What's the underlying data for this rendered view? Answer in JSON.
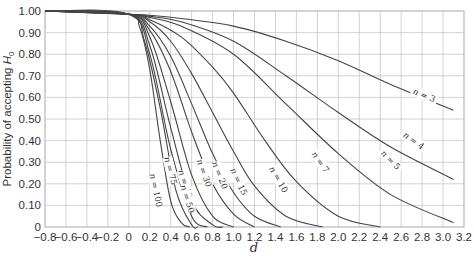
{
  "chart_data": {
    "type": "line",
    "title": "",
    "xlabel": "d",
    "ylabel": "Probability of accepting H0",
    "ylabel_main": "Probability of accepting ",
    "ylabel_sym": "H",
    "ylabel_sub": "0",
    "xlim": [
      -0.8,
      3.2
    ],
    "ylim": [
      0,
      1.0
    ],
    "grid": true,
    "x_ticks": [
      -0.8,
      -0.6,
      -0.4,
      -0.2,
      0,
      0.2,
      0.4,
      0.6,
      0.8,
      1.0,
      1.2,
      1.4,
      1.6,
      1.8,
      2.0,
      2.2,
      2.4,
      2.6,
      2.8,
      3.0,
      3.2
    ],
    "x_tick_labels": [
      "−0.8",
      "−0.6",
      "−0.4",
      "−0.2",
      "0",
      "0.2",
      "0.4",
      "0.6",
      "0.8",
      "1.0",
      "1.2",
      "1.4",
      "1.6",
      "1.8",
      "2.0",
      "2.2",
      "2.4",
      "2.6",
      "2.8",
      "3.0",
      "3.2"
    ],
    "y_ticks": [
      0,
      0.1,
      0.2,
      0.3,
      0.4,
      0.5,
      0.6,
      0.7,
      0.8,
      0.9,
      1.0
    ],
    "y_tick_labels": [
      "0",
      "0.10",
      "0.20",
      "0.30",
      "0.40",
      "0.50",
      "0.60",
      "0.70",
      "0.80",
      "0.90",
      "1.00"
    ],
    "series": [
      {
        "name": "n = 3",
        "x": [
          -0.8,
          0,
          0.2,
          0.5,
          1.0,
          1.5,
          2.0,
          2.5,
          3.1
        ],
        "values": [
          1.0,
          0.985,
          0.98,
          0.965,
          0.93,
          0.86,
          0.77,
          0.66,
          0.54
        ],
        "label_pos": [
          2.82,
          0.61
        ],
        "label_rot": 22
      },
      {
        "name": "n = 4",
        "x": [
          -0.8,
          0,
          0.2,
          0.5,
          1.0,
          1.5,
          2.0,
          2.5,
          3.1
        ],
        "values": [
          1.0,
          0.985,
          0.975,
          0.95,
          0.86,
          0.7,
          0.53,
          0.37,
          0.22
        ],
        "label_pos": [
          2.72,
          0.4
        ],
        "label_rot": 35
      },
      {
        "name": "n = 5",
        "x": [
          -0.8,
          0,
          0.2,
          0.5,
          1.0,
          1.5,
          2.0,
          2.5,
          3.1
        ],
        "values": [
          1.0,
          0.985,
          0.97,
          0.93,
          0.8,
          0.57,
          0.34,
          0.15,
          0.02
        ],
        "label_pos": [
          2.5,
          0.31
        ],
        "label_rot": 45
      },
      {
        "name": "n = 7",
        "x": [
          -0.8,
          0,
          0.2,
          0.5,
          0.8,
          1.0,
          1.3,
          1.6,
          2.0,
          2.4
        ],
        "values": [
          1.0,
          0.985,
          0.96,
          0.88,
          0.74,
          0.62,
          0.4,
          0.21,
          0.05,
          0.0
        ],
        "label_pos": [
          1.83,
          0.3
        ],
        "label_rot": 55
      },
      {
        "name": "n = 10",
        "x": [
          -0.8,
          0,
          0.2,
          0.4,
          0.6,
          0.8,
          1.0,
          1.2,
          1.5,
          1.85
        ],
        "values": [
          1.0,
          0.985,
          0.95,
          0.86,
          0.71,
          0.53,
          0.35,
          0.19,
          0.05,
          0.0
        ],
        "label_pos": [
          1.43,
          0.22
        ],
        "label_rot": 60
      },
      {
        "name": "n = 15",
        "x": [
          -0.8,
          0,
          0.2,
          0.4,
          0.6,
          0.8,
          1.0,
          1.2,
          1.45
        ],
        "values": [
          1.0,
          0.985,
          0.93,
          0.79,
          0.57,
          0.34,
          0.16,
          0.05,
          0.0
        ],
        "label_pos": [
          1.05,
          0.21
        ],
        "label_rot": 65
      },
      {
        "name": "n = 20",
        "x": [
          -0.8,
          0,
          0.2,
          0.4,
          0.6,
          0.8,
          1.0,
          1.2
        ],
        "values": [
          1.0,
          0.985,
          0.91,
          0.72,
          0.44,
          0.2,
          0.06,
          0.0
        ],
        "label_pos": [
          0.87,
          0.24
        ],
        "label_rot": 68
      },
      {
        "name": "n = 30",
        "x": [
          -0.8,
          0,
          0.2,
          0.4,
          0.6,
          0.8,
          1.0
        ],
        "values": [
          1.0,
          0.985,
          0.88,
          0.58,
          0.24,
          0.05,
          0.0
        ],
        "label_pos": [
          0.72,
          0.25
        ],
        "label_rot": 70
      },
      {
        "name": "n = 40",
        "x": [
          -0.8,
          0,
          0.2,
          0.4,
          0.6,
          0.8,
          0.9
        ],
        "values": [
          1.0,
          0.985,
          0.84,
          0.46,
          0.12,
          0.01,
          0.0
        ],
        "label_pos": [
          0.54,
          0.2
        ],
        "label_rot": 72
      },
      {
        "name": "n = 50",
        "x": [
          -0.8,
          0,
          0.2,
          0.4,
          0.6,
          0.75
        ],
        "values": [
          1.0,
          0.985,
          0.8,
          0.36,
          0.05,
          0.0
        ],
        "label_pos": [
          0.56,
          0.13
        ],
        "label_rot": 72
      },
      {
        "name": "n = 75",
        "x": [
          -0.8,
          0,
          0.15,
          0.3,
          0.45,
          0.6,
          0.66
        ],
        "values": [
          1.0,
          0.985,
          0.86,
          0.55,
          0.17,
          0.01,
          0.0
        ],
        "label_pos": [
          0.4,
          0.26
        ],
        "label_rot": 75
      },
      {
        "name": "n = 100",
        "x": [
          -0.8,
          0,
          0.1,
          0.2,
          0.3,
          0.4,
          0.5,
          0.58
        ],
        "values": [
          1.0,
          0.985,
          0.93,
          0.73,
          0.4,
          0.12,
          0.02,
          0.0
        ],
        "label_pos": [
          0.26,
          0.17
        ],
        "label_rot": 78
      }
    ]
  }
}
